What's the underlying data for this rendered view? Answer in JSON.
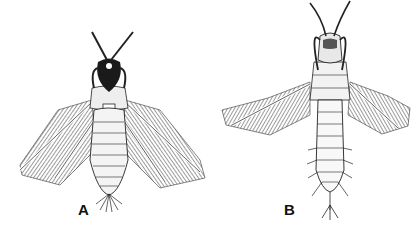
{
  "figure": {
    "panels": [
      {
        "label": "A",
        "subject": "winged insect nymph, dorsal view, dark head with crossed antennae, wings spread"
      },
      {
        "label": "B",
        "subject": "winged insect nymph, dorsal view, long slender abdomen, raised antennae"
      }
    ],
    "caption": "",
    "caption_note": "truncated caption text at bottom edge (illegible)"
  },
  "colors": {
    "background": "#ffffff",
    "ink": "#111111"
  }
}
